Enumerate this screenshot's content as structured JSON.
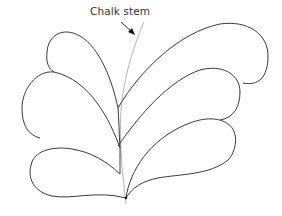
{
  "figure": {
    "label": "Chalk stem",
    "colors": {
      "outline": "#3a3a3a",
      "stem": "#b5b5b5",
      "arrow": "#111111",
      "background": "#ffffff"
    },
    "elements": [
      {
        "type": "chalk-stem",
        "description": "light gray curved guide line"
      },
      {
        "type": "petal",
        "side": "left",
        "position": "top"
      },
      {
        "type": "petal",
        "side": "left",
        "position": "middle"
      },
      {
        "type": "petal",
        "side": "left",
        "position": "bottom"
      },
      {
        "type": "petal",
        "side": "right",
        "position": "top"
      },
      {
        "type": "petal",
        "side": "right",
        "position": "middle"
      },
      {
        "type": "petal",
        "side": "right",
        "position": "bottom"
      },
      {
        "type": "arrow",
        "points_to": "chalk-stem"
      }
    ]
  }
}
